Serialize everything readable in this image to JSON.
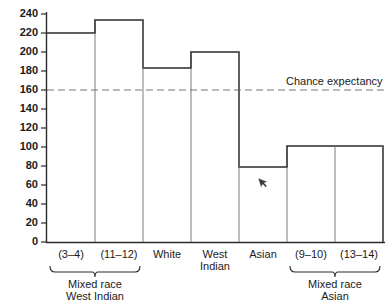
{
  "chart_data": {
    "type": "bar",
    "title": "",
    "subtitle": "",
    "xlabel": "",
    "ylabel": "",
    "categories": [
      "(3–4)",
      "(11–12)",
      "White",
      "West\nIndian",
      "Asian",
      "(9–10)",
      "(13–14)"
    ],
    "category_lines": [
      [
        "(3–4)"
      ],
      [
        "(11–12)"
      ],
      [
        "White"
      ],
      [
        "West",
        "Indian"
      ],
      [
        "Asian"
      ],
      [
        "(9–10)"
      ],
      [
        "(13–14)"
      ]
    ],
    "values": [
      220,
      234,
      183,
      200,
      79,
      101,
      101
    ],
    "ylim": [
      0,
      240
    ],
    "yticks": [
      0,
      20,
      40,
      60,
      80,
      100,
      120,
      140,
      160,
      180,
      200,
      220,
      240
    ],
    "ytick_labels": [
      "0",
      "20",
      "40",
      "60",
      "80",
      "100",
      "120",
      "140",
      "160",
      "180",
      "200",
      "220",
      "240"
    ],
    "grid": false,
    "legend_position": "none",
    "annotations": [
      {
        "name": "chance-expectancy",
        "label": "Chance expectancy",
        "value": 160,
        "style": "dashed-horizontal-line"
      }
    ],
    "groups": [
      {
        "label_lines": [
          "Mixed race",
          "West Indian"
        ],
        "label": "Mixed race West Indian",
        "member_indices": [
          0,
          1
        ]
      },
      {
        "label_lines": [
          "Mixed race",
          "Asian"
        ],
        "label": "Mixed race Asian",
        "member_indices": [
          5,
          6
        ]
      }
    ],
    "colors": {
      "outline": "#2b2b2b",
      "divider": "#6e6e6e",
      "chance_line": "#777777",
      "background": "#ffffff",
      "text": "#1a1a1a"
    }
  },
  "axis": {
    "y_tick_0": "0",
    "y_tick_20": "20",
    "y_tick_40": "40",
    "y_tick_60": "60",
    "y_tick_80": "80",
    "y_tick_100": "100",
    "y_tick_120": "120",
    "y_tick_140": "140",
    "y_tick_160": "160",
    "y_tick_180": "180",
    "y_tick_200": "200",
    "y_tick_220": "220",
    "y_tick_240": "240"
  },
  "labels": {
    "cat_0": "(3–4)",
    "cat_1": "(11–12)",
    "cat_2": "White",
    "cat_3_line1": "West",
    "cat_3_line2": "Indian",
    "cat_4": "Asian",
    "cat_5": "(9–10)",
    "cat_6": "(13–14)",
    "group_0_line1": "Mixed race",
    "group_0_line2": "West Indian",
    "group_1_line1": "Mixed race",
    "group_1_line2": "Asian",
    "chance_expectancy": "Chance expectancy"
  },
  "cursor": {
    "name": "mouse-pointer",
    "x": 258,
    "y": 178
  }
}
